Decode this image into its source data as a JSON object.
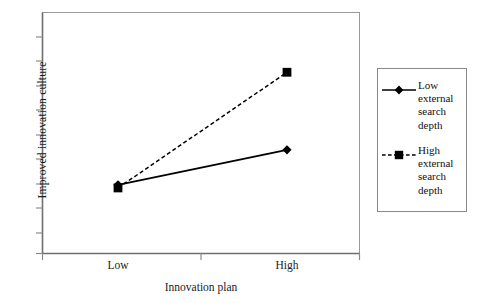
{
  "chart_data": {
    "type": "line",
    "title": "",
    "subtitle": "",
    "xlabel": "Innovation plan",
    "ylabel": "Improved  innovation culture",
    "categories": [
      "Low",
      "High"
    ],
    "x": [
      0,
      1
    ],
    "xlim": [
      -0.45,
      1.45
    ],
    "ylim": [
      0,
      1
    ],
    "grid": false,
    "y_tick_labels": [],
    "x_tick_labels": [
      "Low",
      "High"
    ],
    "legend_position": "right-outside",
    "legend_border": true,
    "annotations": [],
    "series": [
      {
        "name": "Low external search depth",
        "values": [
          0.285,
          0.43
        ],
        "marker": "diamond",
        "linestyle": "solid",
        "color": "#000000"
      },
      {
        "name": "High external search depth",
        "values": [
          0.272,
          0.752
        ],
        "marker": "square",
        "linestyle": "dashed",
        "color": "#000000"
      }
    ]
  },
  "axes": {
    "x_title": "Innovation plan",
    "y_title": "Improved  innovation culture",
    "tick_low": "Low",
    "tick_high": "High"
  },
  "legend": {
    "entries": [
      {
        "marker": "diamond-marker",
        "linestyle": "solid",
        "lines": [
          "Low",
          "external",
          "search",
          "depth"
        ],
        "full_label": "Low external search depth"
      },
      {
        "marker": "square-marker",
        "linestyle": "dashed",
        "lines": [
          "High",
          "external",
          "search",
          "depth"
        ],
        "full_label": "High external search depth"
      }
    ]
  },
  "colors": {
    "line": "#000000",
    "axis": "#6f6f6f",
    "frame": "#8a8a8a",
    "text": "#111111",
    "background": "#ffffff"
  }
}
